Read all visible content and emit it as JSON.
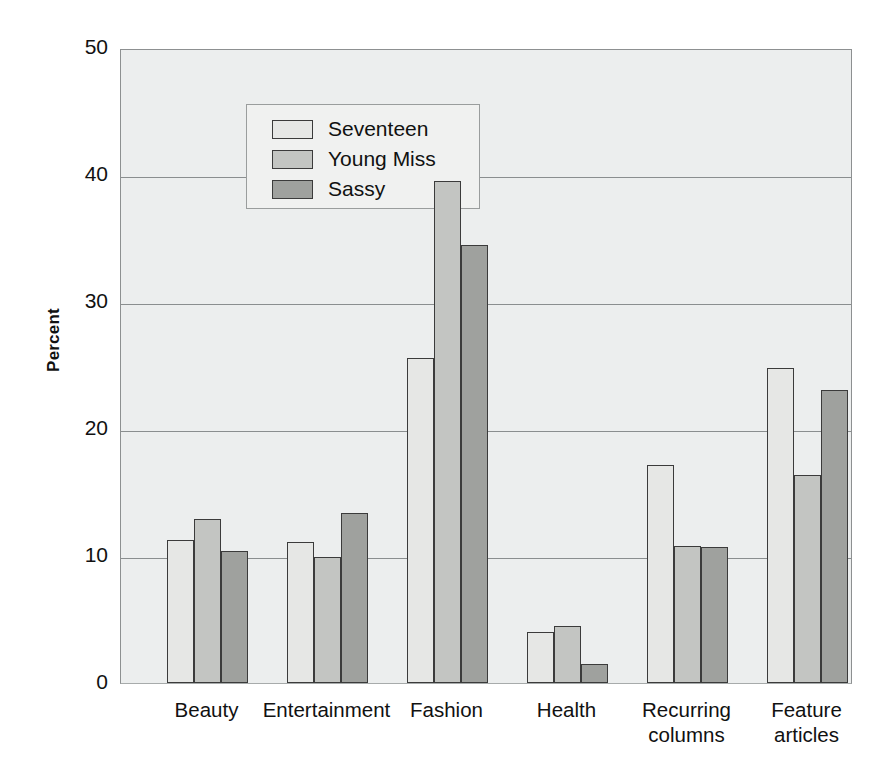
{
  "chart_data": {
    "type": "bar",
    "title": "",
    "xlabel": "",
    "ylabel": "Percent",
    "ylim": [
      0,
      50
    ],
    "yticks": [
      0,
      10,
      20,
      30,
      40,
      50
    ],
    "grid": true,
    "legend_position": "top-left",
    "categories": [
      "Beauty",
      "Entertainment",
      "Fashion",
      "Health",
      "Recurring\ncolumns",
      "Feature\narticles"
    ],
    "series": [
      {
        "name": "Seventeen",
        "color": "#e6e7e5",
        "values": [
          11.3,
          11.1,
          25.6,
          4.0,
          17.2,
          24.8
        ]
      },
      {
        "name": "Young Miss",
        "color": "#c3c5c2",
        "values": [
          12.9,
          9.9,
          39.5,
          4.5,
          10.8,
          16.4
        ]
      },
      {
        "name": "Sassy",
        "color": "#9fa19e",
        "values": [
          10.4,
          13.4,
          34.5,
          1.5,
          10.7,
          23.1
        ]
      }
    ]
  },
  "axis": {
    "y_title": "Percent",
    "tick_labels": [
      "50",
      "40",
      "30",
      "20",
      "10",
      "0"
    ]
  },
  "legend": {
    "items": [
      {
        "label": "Seventeen"
      },
      {
        "label": "Young Miss"
      },
      {
        "label": "Sassy"
      }
    ]
  },
  "colors": {
    "series_1": "#e6e7e5",
    "series_2": "#c3c5c2",
    "series_3": "#9fa19e",
    "plot_background": "#eceeee",
    "gridline": "#8a8e8f",
    "bar_outline": "#3b3b3b",
    "text": "#111111"
  }
}
